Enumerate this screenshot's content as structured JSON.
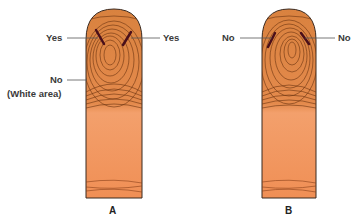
{
  "figure": {
    "panels": [
      {
        "id": "A",
        "label": "A",
        "annotations": {
          "left_upper": "Yes",
          "right_upper": "Yes",
          "left_lower": "No",
          "left_lower_note": "(White area)"
        }
      },
      {
        "id": "B",
        "label": "B",
        "annotations": {
          "left_upper": "No",
          "right_upper": "No"
        }
      }
    ],
    "colors": {
      "skin_upper": "#d9823f",
      "skin_lower": "#f29a62",
      "ridge": "#6b3410",
      "marker": "#4a0f1a",
      "outline": "#3b2a20",
      "leader_line": "#555555"
    }
  }
}
